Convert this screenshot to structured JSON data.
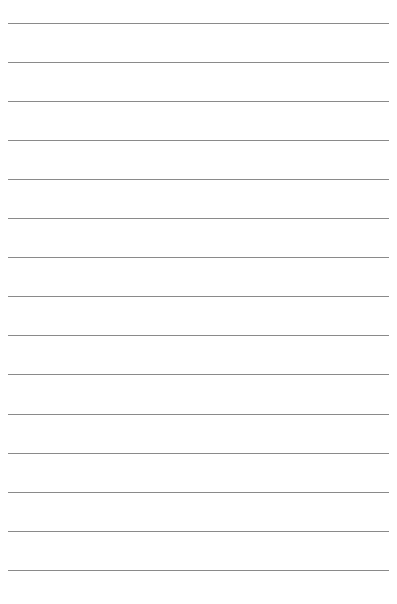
{
  "page": {
    "type": "lined-paper",
    "line_color": "#8a8a8a",
    "line_count": 15,
    "line_left": 8,
    "line_right": 389,
    "line_positions": [
      23,
      62,
      101,
      140,
      179,
      218,
      257,
      296,
      335,
      374,
      414,
      453,
      492,
      531,
      570
    ]
  }
}
